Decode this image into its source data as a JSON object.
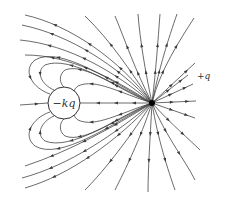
{
  "diagram": {
    "labels": {
      "negative_charge": "−kq",
      "positive_charge": "+q"
    },
    "colors": {
      "line": "#3a3a3a",
      "charge_fill": "#000000",
      "circle_stroke": "#333333",
      "background": "#ffffff"
    },
    "positive_charge": {
      "x": 152,
      "y": 103,
      "r": 3
    },
    "negative_charge": {
      "x": 64,
      "y": 103,
      "r": 16
    },
    "field_lines": [
      {
        "d": "M152,103 C120,60 70,25 25,15",
        "arrows": [
          0.3,
          0.55,
          0.8
        ]
      },
      {
        "d": "M152,103 C118,66 70,35 22,25",
        "arrows": [
          0.3,
          0.55,
          0.8
        ]
      },
      {
        "d": "M152,103 C115,72 70,45 20,40",
        "arrows": [
          0.3,
          0.55,
          0.8
        ]
      },
      {
        "d": "M152,103 C112,78 70,55 25,55",
        "arrows": [
          0.3,
          0.55,
          0.8
        ]
      },
      {
        "d": "M152,103 C112,82 60,45 35,60 C22,70 32,88 50,94",
        "arrows": [
          0.3,
          0.6,
          0.85
        ]
      },
      {
        "d": "M152,103 C115,86 70,55 45,65 C35,72 42,85 54,90",
        "arrows": [
          0.3,
          0.6,
          0.85
        ]
      },
      {
        "d": "M152,103 C118,90 85,62 65,70 C58,75 60,84 64,87",
        "arrows": [
          0.35,
          0.7
        ]
      },
      {
        "d": "M152,103 C120,93 95,78 78,86 C74,89 74,91 75,92",
        "arrows": [
          0.4,
          0.75
        ]
      },
      {
        "d": "M152,103 L80,103",
        "arrows": [
          0.25,
          0.5,
          0.75
        ]
      },
      {
        "d": "M152,103 C120,113 95,128 78,120 C74,117 74,115 75,114",
        "arrows": [
          0.4,
          0.75
        ]
      },
      {
        "d": "M152,103 C118,116 85,144 65,136 C58,131 60,122 64,119",
        "arrows": [
          0.35,
          0.7
        ]
      },
      {
        "d": "M152,103 C115,120 70,151 45,141 C35,134 42,121 54,116",
        "arrows": [
          0.3,
          0.6,
          0.85
        ]
      },
      {
        "d": "M152,103 C112,124 60,161 35,146 C22,136 32,118 50,112",
        "arrows": [
          0.3,
          0.6,
          0.85
        ]
      },
      {
        "d": "M152,103 C112,128 70,151 25,166",
        "arrows": [
          0.3,
          0.55,
          0.8
        ]
      },
      {
        "d": "M152,103 C115,134 70,165 22,178",
        "arrows": [
          0.3,
          0.55,
          0.8
        ]
      },
      {
        "d": "M152,103 C118,140 70,175 25,188",
        "arrows": [
          0.3,
          0.55,
          0.8
        ]
      },
      {
        "d": "M152,103 C125,145 100,175 85,190",
        "arrows": [
          0.35,
          0.65
        ]
      },
      {
        "d": "M152,103 C140,140 125,170 115,190",
        "arrows": [
          0.35,
          0.65
        ]
      },
      {
        "d": "M152,103 C150,140 148,170 148,192",
        "arrows": [
          0.35,
          0.65
        ]
      },
      {
        "d": "M152,103 C158,140 168,170 175,190",
        "arrows": [
          0.35,
          0.65
        ]
      },
      {
        "d": "M152,103 C165,135 185,160 195,180",
        "arrows": [
          0.35,
          0.65
        ]
      },
      {
        "d": "M152,103 C172,125 190,140 200,150",
        "arrows": [
          0.35,
          0.65
        ]
      },
      {
        "d": "M152,103 L195,118",
        "arrows": [
          0.45,
          0.8
        ]
      },
      {
        "d": "M152,103 L196,101",
        "arrows": [
          0.45,
          0.8
        ]
      },
      {
        "d": "M152,103 L193,84",
        "arrows": [
          0.45,
          0.8
        ]
      },
      {
        "d": "M152,103 L188,75",
        "arrows": [
          0.45,
          0.8
        ]
      },
      {
        "d": "M152,103 L195,63",
        "arrows": [
          0.45,
          0.8
        ]
      },
      {
        "d": "M152,103 C160,70 180,40 194,18",
        "arrows": [
          0.35,
          0.65
        ]
      },
      {
        "d": "M152,103 C160,65 168,40 177,14",
        "arrows": [
          0.35,
          0.65
        ]
      },
      {
        "d": "M152,103 C156,70 158,40 160,14",
        "arrows": [
          0.35,
          0.65
        ]
      },
      {
        "d": "M152,103 C145,70 140,40 138,14",
        "arrows": [
          0.35,
          0.65
        ]
      },
      {
        "d": "M152,103 C135,70 125,40 115,16",
        "arrows": [
          0.35,
          0.65
        ]
      },
      {
        "d": "M152,103 C130,70 110,40 85,16",
        "arrows": [
          0.35,
          0.65
        ]
      },
      {
        "d": "M20,105 L48,103",
        "arrows": [
          0.6
        ]
      }
    ]
  }
}
